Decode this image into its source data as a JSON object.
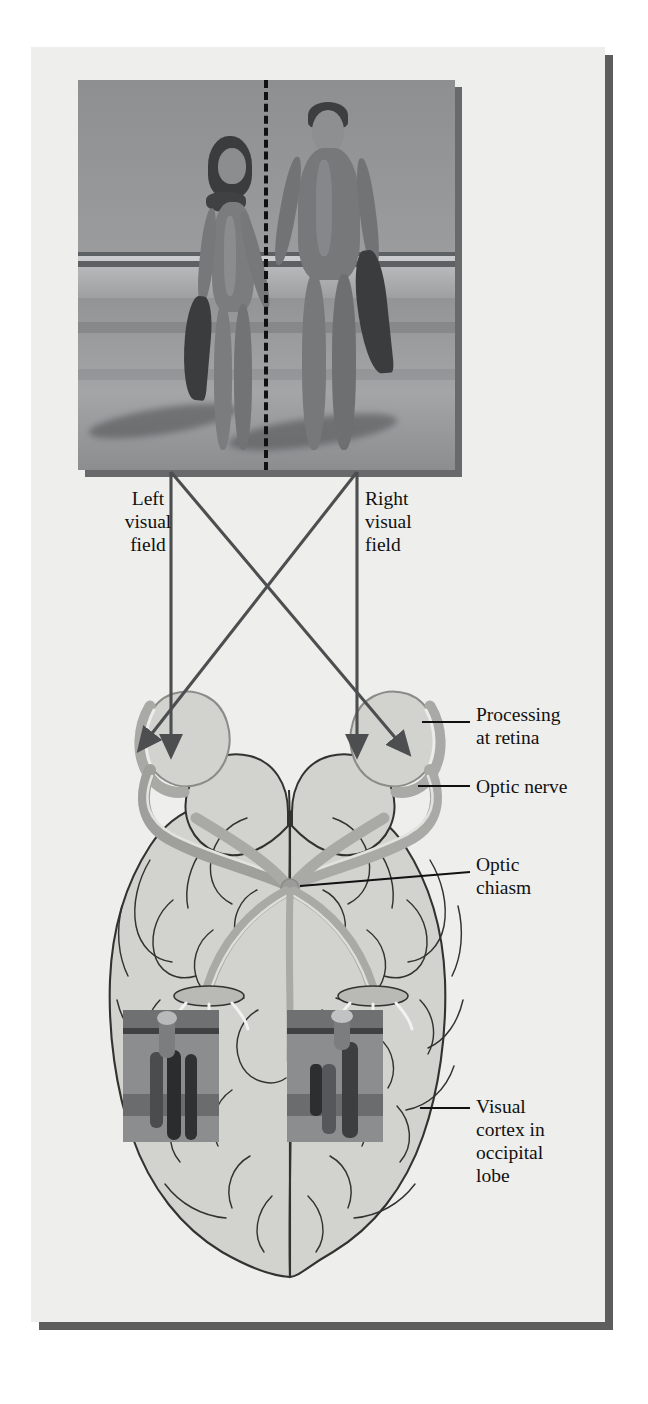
{
  "figure": {
    "panel_background": "#eeeeec",
    "panel_shadow": "#5d5d5d",
    "ink": "#111111",
    "brain_fill": "#d2d2cf",
    "nerve_fill": "#a9a9a6",
    "nerve_edge": "#8b8b88",
    "photo_shadow": "#67696b"
  },
  "stimulus": {
    "caption": "photograph of a couple walking on a beach carrying fins",
    "midline_style": "dashed",
    "midline_color": "#111111"
  },
  "labels": {
    "left_visual_field": "Left\nvisual\nfield",
    "right_visual_field": "Right\nvisual\nfield",
    "processing_at_retina": "Processing\nat retina",
    "optic_nerve": "Optic nerve",
    "optic_chiasm": "Optic\nchiasm",
    "visual_cortex": "Visual\ncortex in\noccipital\nlobe"
  },
  "structures": {
    "left_eye": "left eye",
    "right_eye": "right eye",
    "optic_chiasm": "optic chiasm",
    "left_occipital_inset": "inverted left half of scene projected on right hemisphere cortex",
    "right_occipital_inset": "inverted right half of scene projected on left hemisphere cortex"
  },
  "pathways": [
    {
      "name": "left-field-to-left-eye",
      "from": "left visual field",
      "to": "left eye",
      "type": "straight"
    },
    {
      "name": "right-field-to-right-eye",
      "from": "right visual field",
      "to": "right eye",
      "type": "straight"
    },
    {
      "name": "left-field-crossing",
      "from": "left visual field",
      "to": "right eye",
      "type": "crossing"
    },
    {
      "name": "right-field-crossing",
      "from": "right visual field",
      "to": "left eye",
      "type": "crossing"
    }
  ]
}
